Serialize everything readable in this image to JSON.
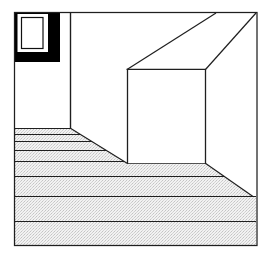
{
  "figure": {
    "name": "perspective-room-interior",
    "background_color": "#ffffff",
    "stroke_color": "#1a1a1a",
    "floor_fill_color": "#efefef",
    "floor_stipple_color": "#bfbfbf",
    "window_shadow_color": "#000000",
    "window_glass_color": "#ffffff"
  },
  "caption": {
    "text": "Fig. 3  Perspective construction of an interior: floor planks converge",
    "visible_fragment": "clipped top line of descender text",
    "color": "#c9c9cf"
  },
  "frame": {
    "label": "picture-frame-border",
    "x": 14,
    "y": 12,
    "width": 243,
    "height": 234,
    "stroke_width": 1.1
  },
  "geometry": {
    "units": "pixels",
    "back_wall": {
      "left": 127,
      "right": 205,
      "top": 69,
      "bottom": 163
    },
    "left_wall_edge_x": 70,
    "ceiling_diagonals": [
      {
        "from": [
          127,
          69
        ],
        "to": [
          216,
          13
        ]
      },
      {
        "from": [
          205,
          69
        ],
        "to": [
          256,
          13
        ]
      }
    ],
    "floor_left_diagonal": {
      "from": [
        70,
        128
      ],
      "to": [
        127,
        163
      ]
    },
    "floor_right_diagonal": {
      "from": [
        205,
        163
      ],
      "to": [
        252,
        196
      ]
    },
    "floor_plank_lines_y": [
      128,
      134,
      141,
      150,
      161,
      176,
      196,
      221,
      245
    ],
    "plank_count": 9
  },
  "window": {
    "label": "left-wall-window",
    "shadow_block": {
      "x": 14,
      "y": 12,
      "width": 46,
      "height": 50
    },
    "mat": {
      "x": 17,
      "y": 14,
      "width": 31,
      "height": 39
    },
    "glass": {
      "x": 21,
      "y": 17,
      "width": 22,
      "height": 32
    },
    "frame_stroke_width": 1.2
  }
}
